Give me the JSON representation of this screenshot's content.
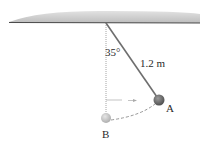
{
  "figure": {
    "type": "pendulum-diagram",
    "angle_label": "35°",
    "length_label": "1.2 m",
    "point_a_label": "A",
    "point_b_label": "B",
    "angle_deg": 35,
    "length_m": 1.2,
    "colors": {
      "ceiling_fill": "#c9c9c9",
      "ceiling_edge": "#4a4a4a",
      "string": "#6e6e6e",
      "ball_a": "#6a6a6a",
      "ball_b": "#c4c4c4",
      "dotted_line": "#9a9a9a",
      "dashed_arc": "#8a8a8a",
      "text": "#2a2a2a"
    }
  }
}
